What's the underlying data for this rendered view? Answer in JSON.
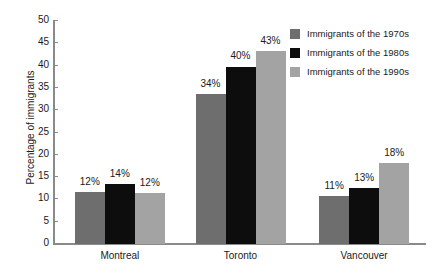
{
  "chart_data": {
    "type": "bar",
    "title": "",
    "subtitle": "",
    "xlabel": "",
    "ylabel": "Percentage of immigrants",
    "ylim": [
      0,
      50
    ],
    "ytick_step": 5,
    "yticks": [
      50,
      45,
      40,
      35,
      30,
      25,
      20,
      15,
      10,
      5,
      0
    ],
    "ytick_labels": [
      "50",
      "45",
      "40",
      "35",
      "30",
      "25",
      "20",
      "15",
      "10",
      "5",
      "0"
    ],
    "grid": false,
    "legend_position": "top-right",
    "value_suffix": "%",
    "categories": [
      "Montreal",
      "Toronto",
      "Vancouver"
    ],
    "series": [
      {
        "name": "Immigrants of the 1970s",
        "color": "#6e6e6e",
        "values": [
          12,
          34,
          11
        ],
        "value_labels": [
          "12%",
          "34%",
          "11%"
        ],
        "plotted_heights": [
          11.6,
          33.7,
          10.7
        ]
      },
      {
        "name": "Immigrants of the 1980s",
        "color": "#0d0d0d",
        "values": [
          14,
          40,
          13
        ],
        "value_labels": [
          "14%",
          "40%",
          "13%"
        ],
        "plotted_heights": [
          13.4,
          39.8,
          12.5
        ]
      },
      {
        "name": "Immigrants of the 1990s",
        "color": "#a3a3a3",
        "values": [
          12,
          43,
          18
        ],
        "value_labels": [
          "12%",
          "43%",
          "18%"
        ],
        "plotted_heights": [
          11.5,
          43.2,
          18.1
        ]
      }
    ],
    "axis_color": "#8a8a8a",
    "text_color": "#1a1a1a",
    "background": "#ffffff"
  }
}
